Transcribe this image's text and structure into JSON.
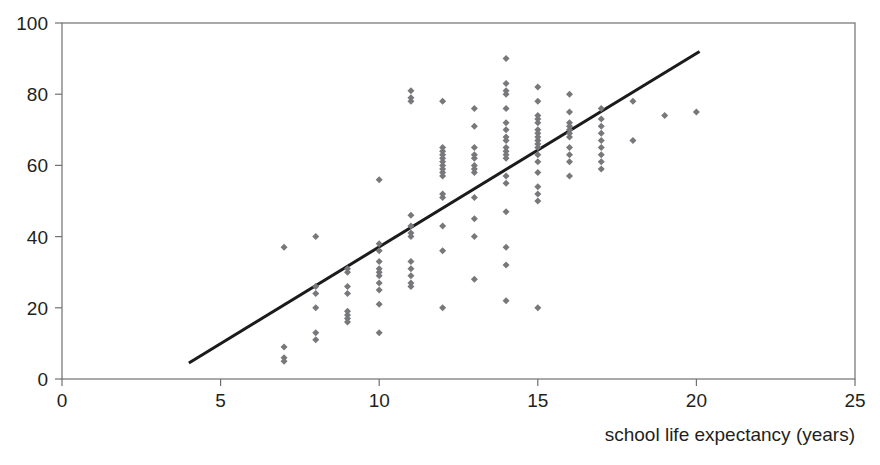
{
  "chart_data": {
    "type": "scatter",
    "title": "",
    "subtitle": "",
    "xlabel": "school life expectancy (years)",
    "ylabel": "",
    "xlim": [
      0,
      25
    ],
    "ylim": [
      0,
      100
    ],
    "xticks": [
      0,
      5,
      10,
      15,
      20,
      25
    ],
    "xtick_labels": [
      "0",
      "5",
      "10",
      "15",
      "20",
      "25"
    ],
    "yticks": [
      0,
      20,
      40,
      60,
      80,
      100
    ],
    "ytick_labels": [
      "0",
      "20",
      "40",
      "60",
      "80",
      "100"
    ],
    "grid": false,
    "legend": null,
    "marker_shape": "diamond",
    "marker_color": "#77787b",
    "marker_size": 7,
    "axis_color": "#6f7072",
    "text_color": "#231f20",
    "background_color": "#ffffff",
    "annotations": [],
    "series": [
      {
        "name": "countries",
        "type": "scatter",
        "points": [
          [
            7,
            37
          ],
          [
            7,
            9
          ],
          [
            7,
            6
          ],
          [
            7,
            5
          ],
          [
            8,
            40
          ],
          [
            8,
            26
          ],
          [
            8,
            24
          ],
          [
            8,
            20
          ],
          [
            8,
            13
          ],
          [
            8,
            11
          ],
          [
            9,
            31
          ],
          [
            9,
            30
          ],
          [
            9,
            26
          ],
          [
            9,
            24
          ],
          [
            9,
            19
          ],
          [
            9,
            18
          ],
          [
            9,
            17
          ],
          [
            9,
            16
          ],
          [
            10,
            56
          ],
          [
            10,
            38
          ],
          [
            10,
            36
          ],
          [
            10,
            33
          ],
          [
            10,
            31
          ],
          [
            10,
            30
          ],
          [
            10,
            29
          ],
          [
            10,
            27
          ],
          [
            10,
            25
          ],
          [
            10,
            21
          ],
          [
            10,
            13
          ],
          [
            11,
            81
          ],
          [
            11,
            79
          ],
          [
            11,
            78
          ],
          [
            11,
            46
          ],
          [
            11,
            43
          ],
          [
            11,
            41
          ],
          [
            11,
            40
          ],
          [
            11,
            33
          ],
          [
            11,
            31
          ],
          [
            11,
            29
          ],
          [
            11,
            27
          ],
          [
            11,
            26
          ],
          [
            12,
            78
          ],
          [
            12,
            65
          ],
          [
            12,
            64
          ],
          [
            12,
            63
          ],
          [
            12,
            62
          ],
          [
            12,
            61
          ],
          [
            12,
            60
          ],
          [
            12,
            59
          ],
          [
            12,
            58
          ],
          [
            12,
            57
          ],
          [
            12,
            52
          ],
          [
            12,
            51
          ],
          [
            12,
            43
          ],
          [
            12,
            36
          ],
          [
            12,
            20
          ],
          [
            13,
            76
          ],
          [
            13,
            71
          ],
          [
            13,
            65
          ],
          [
            13,
            63
          ],
          [
            13,
            62
          ],
          [
            13,
            60
          ],
          [
            13,
            59
          ],
          [
            13,
            58
          ],
          [
            13,
            51
          ],
          [
            13,
            45
          ],
          [
            13,
            40
          ],
          [
            13,
            28
          ],
          [
            14,
            90
          ],
          [
            14,
            83
          ],
          [
            14,
            81
          ],
          [
            14,
            80
          ],
          [
            14,
            76
          ],
          [
            14,
            72
          ],
          [
            14,
            70
          ],
          [
            14,
            68
          ],
          [
            14,
            67
          ],
          [
            14,
            65
          ],
          [
            14,
            64
          ],
          [
            14,
            63
          ],
          [
            14,
            62
          ],
          [
            14,
            57
          ],
          [
            14,
            55
          ],
          [
            14,
            47
          ],
          [
            14,
            37
          ],
          [
            14,
            32
          ],
          [
            14,
            22
          ],
          [
            15,
            82
          ],
          [
            15,
            78
          ],
          [
            15,
            74
          ],
          [
            15,
            73
          ],
          [
            15,
            72
          ],
          [
            15,
            70
          ],
          [
            15,
            69
          ],
          [
            15,
            68
          ],
          [
            15,
            67
          ],
          [
            15,
            66
          ],
          [
            15,
            65
          ],
          [
            15,
            63
          ],
          [
            15,
            61
          ],
          [
            15,
            58
          ],
          [
            15,
            54
          ],
          [
            15,
            52
          ],
          [
            15,
            50
          ],
          [
            15,
            20
          ],
          [
            16,
            80
          ],
          [
            16,
            75
          ],
          [
            16,
            72
          ],
          [
            16,
            71
          ],
          [
            16,
            70
          ],
          [
            16,
            69
          ],
          [
            16,
            68
          ],
          [
            16,
            65
          ],
          [
            16,
            63
          ],
          [
            16,
            61
          ],
          [
            16,
            57
          ],
          [
            17,
            76
          ],
          [
            17,
            73
          ],
          [
            17,
            71
          ],
          [
            17,
            69
          ],
          [
            17,
            67
          ],
          [
            17,
            65
          ],
          [
            17,
            63
          ],
          [
            17,
            61
          ],
          [
            17,
            59
          ],
          [
            18,
            78
          ],
          [
            18,
            67
          ],
          [
            19,
            74
          ],
          [
            20,
            75
          ]
        ]
      },
      {
        "name": "trend line",
        "type": "line",
        "x_start": 4,
        "y_start": 4.5,
        "x_end": 20.1,
        "y_end": 92
      }
    ]
  }
}
